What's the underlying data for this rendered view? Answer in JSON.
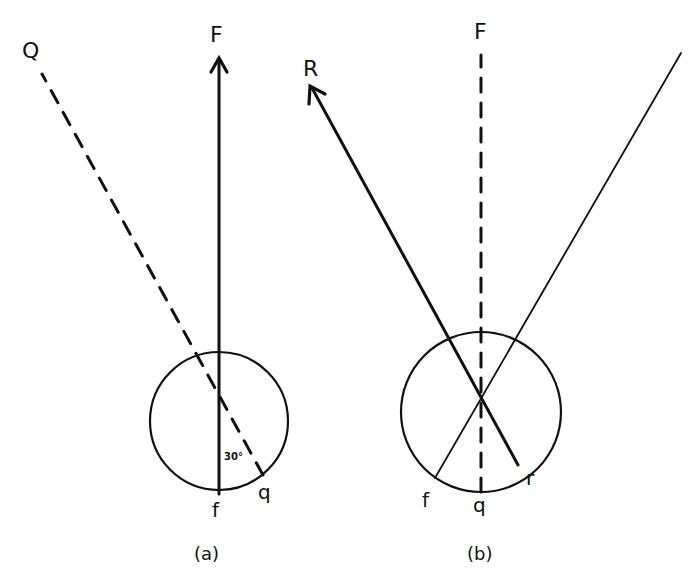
{
  "diagram": {
    "panel_a": {
      "caption": "(a)",
      "labels": {
        "F": "F",
        "Q": "Q",
        "f": "f",
        "q": "q",
        "angle": "30°"
      },
      "elements": [
        "circle",
        "solid arrow from f up to F",
        "dashed line from q up-left to Q",
        "angle mark 30° between f-line and q-line"
      ]
    },
    "panel_b": {
      "caption": "(b)",
      "labels": {
        "F": "F",
        "R": "R",
        "f": "f",
        "q": "q",
        "r": "r"
      },
      "elements": [
        "circle",
        "dashed vertical line from q up to F",
        "solid arrow from r up-left to R",
        "thin solid line from f up-right beyond figure"
      ]
    },
    "colors": {
      "ink": "#111111",
      "background": "#ffffff"
    }
  }
}
